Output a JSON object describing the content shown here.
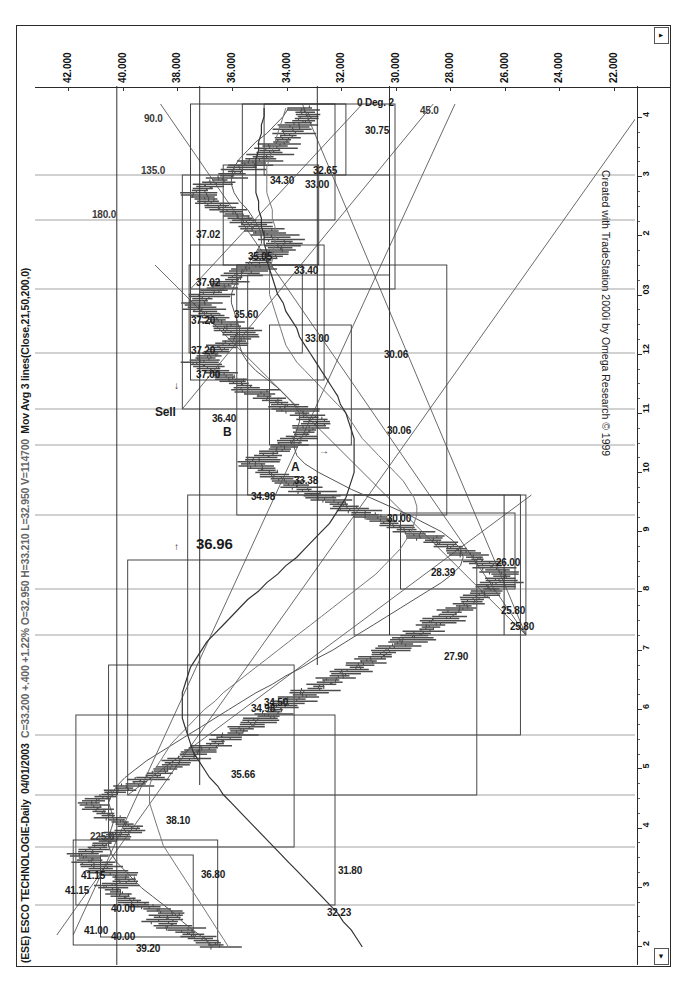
{
  "window": {
    "title_symbol": "(ESE) ESCO TECHNOLOGIE-Daily",
    "title_date": "04/01/2003",
    "title_quote": "C=33.200 +.400 +1.22%  O=32.950  H=33.210  L=32.950  V=114700",
    "title_study": "Mov Avg 3 lines(Close,21,50,200,0)",
    "credit": "Created with TradeStation 2000i by Omega Research © 1999",
    "scroll_left_icon": "◄",
    "scroll_right_icon": "▼"
  },
  "chart_data": {
    "type": "line",
    "title": "(ESE) ESCO TECHNOLOGIE-Daily",
    "xlabel": "",
    "ylabel": "Price",
    "ylim": [
      21.0,
      43.0
    ],
    "grid": false,
    "legend_position": "none",
    "price_axis_ticks": [
      "42.000",
      "40.000",
      "38.000",
      "36.000",
      "34.000",
      "32.000",
      "30.000",
      "28.000",
      "26.000",
      "24.000",
      "22.000"
    ],
    "price_axis_values": [
      42.0,
      40.0,
      38.0,
      36.0,
      34.0,
      32.0,
      30.0,
      28.0,
      26.0,
      24.0,
      22.0
    ],
    "date_axis_ticks": [
      "2",
      "3",
      "4",
      "5",
      "6",
      "7",
      "8",
      "9",
      "10",
      "11",
      "12",
      "03",
      "2",
      "3",
      "4"
    ],
    "quote": {
      "date": "04/01/2003",
      "close": 33.2,
      "change": 0.4,
      "change_pct": "+1.22%",
      "open": 32.95,
      "high": 33.21,
      "low": 32.95,
      "volume": 114700
    },
    "studies": [
      {
        "name": "Mov Avg 3 lines",
        "inputs": "Close,21,50,200,0"
      }
    ],
    "series": [
      {
        "name": "Close",
        "x": [
          0,
          1,
          2,
          3,
          4,
          5,
          6,
          7,
          8,
          9,
          10,
          11,
          12,
          13,
          14,
          15,
          16,
          17,
          18,
          19,
          20,
          21,
          22,
          23,
          24,
          25,
          26,
          27,
          28,
          29,
          30,
          31,
          32,
          33,
          34,
          35,
          36,
          37,
          38,
          39,
          40,
          41,
          42,
          43,
          44,
          45,
          46,
          47,
          48,
          49,
          50,
          51,
          52,
          53,
          54,
          55,
          56,
          57,
          58,
          59,
          60,
          61,
          62,
          63,
          64,
          65,
          66,
          67,
          68,
          69,
          70,
          71,
          72,
          73,
          74,
          75,
          76,
          77,
          78,
          79,
          80,
          81,
          82,
          83,
          84,
          85,
          86,
          87,
          88,
          89,
          90,
          91,
          92,
          93,
          94,
          95,
          96,
          97,
          98,
          99
        ],
        "values": [
          36.2,
          36.9,
          37.6,
          38.3,
          38.0,
          39.2,
          39.8,
          40.2,
          39.6,
          40.4,
          40.9,
          41.15,
          40.6,
          40.1,
          39.4,
          40.0,
          40.6,
          41.0,
          40.3,
          39.5,
          38.8,
          38.2,
          37.6,
          37.0,
          36.4,
          35.8,
          35.2,
          34.6,
          34.1,
          33.6,
          33.0,
          32.4,
          31.8,
          31.2,
          30.6,
          30.0,
          29.4,
          28.9,
          28.4,
          27.9,
          27.4,
          26.9,
          26.4,
          26.0,
          25.8,
          26.3,
          26.9,
          27.6,
          28.4,
          29.2,
          30.0,
          30.8,
          31.6,
          32.4,
          33.1,
          33.8,
          34.4,
          34.98,
          34.5,
          33.9,
          33.38,
          33.0,
          32.6,
          33.2,
          33.9,
          34.6,
          35.2,
          35.8,
          36.4,
          36.96,
          36.5,
          36.0,
          35.4,
          35.8,
          36.3,
          36.8,
          37.0,
          36.6,
          36.1,
          35.6,
          35.05,
          34.6,
          34.2,
          33.8,
          34.3,
          34.9,
          35.4,
          36.0,
          36.6,
          37.02,
          36.5,
          35.9,
          35.3,
          34.7,
          34.3,
          34.0,
          33.6,
          33.4,
          33.0,
          33.2
        ]
      },
      {
        "name": "MA 21",
        "values": [
          36.5,
          36.8,
          37.2,
          37.6,
          37.9,
          38.3,
          38.7,
          39.1,
          39.4,
          39.7,
          40.0,
          40.2,
          40.3,
          40.3,
          40.2,
          40.1,
          40.2,
          40.3,
          40.2,
          40.0,
          39.7,
          39.3,
          38.9,
          38.4,
          37.9,
          37.4,
          36.9,
          36.4,
          35.9,
          35.4,
          34.9,
          34.3,
          33.8,
          33.2,
          32.7,
          32.1,
          31.6,
          31.1,
          30.6,
          30.1,
          29.6,
          29.1,
          28.6,
          28.1,
          27.7,
          27.4,
          27.3,
          27.4,
          27.7,
          28.1,
          28.7,
          29.3,
          30.0,
          30.7,
          31.4,
          32.0,
          32.6,
          33.1,
          33.4,
          33.5,
          33.5,
          33.4,
          33.3,
          33.3,
          33.5,
          33.8,
          34.1,
          34.5,
          34.9,
          35.2,
          35.4,
          35.5,
          35.5,
          35.5,
          35.6,
          35.7,
          35.8,
          35.8,
          35.7,
          35.5,
          35.3,
          35.1,
          34.9,
          34.7,
          34.7,
          34.8,
          35.0,
          35.2,
          35.5,
          35.7,
          35.8,
          35.8,
          35.7,
          35.5,
          35.2,
          34.9,
          34.5,
          34.2,
          33.9,
          33.7
        ]
      },
      {
        "name": "MA 50",
        "values": [
          35.9,
          36.1,
          36.3,
          36.5,
          36.7,
          36.9,
          37.1,
          37.3,
          37.5,
          37.7,
          37.9,
          38.1,
          38.3,
          38.4,
          38.5,
          38.6,
          38.7,
          38.8,
          38.8,
          38.8,
          38.7,
          38.6,
          38.4,
          38.2,
          38.0,
          37.7,
          37.4,
          37.1,
          36.8,
          36.4,
          36.1,
          35.7,
          35.3,
          34.9,
          34.5,
          34.1,
          33.7,
          33.3,
          32.9,
          32.5,
          32.1,
          31.7,
          31.3,
          30.9,
          30.5,
          30.2,
          29.9,
          29.6,
          29.4,
          29.2,
          29.1,
          29.0,
          29.0,
          29.1,
          29.3,
          29.5,
          29.8,
          30.1,
          30.4,
          30.7,
          31.0,
          31.2,
          31.4,
          31.6,
          31.9,
          32.2,
          32.5,
          32.8,
          33.1,
          33.4,
          33.6,
          33.8,
          33.9,
          34.0,
          34.1,
          34.2,
          34.3,
          34.4,
          34.4,
          34.4,
          34.4,
          34.3,
          34.3,
          34.2,
          34.2,
          34.2,
          34.3,
          34.3,
          34.4,
          34.5,
          34.5,
          34.5,
          34.5,
          34.4,
          34.3,
          34.2,
          34.1,
          34.0,
          33.9,
          33.8
        ]
      },
      {
        "name": "MA 200",
        "values": [
          31.0,
          31.2,
          31.4,
          31.7,
          31.9,
          32.2,
          32.5,
          32.8,
          33.1,
          33.4,
          33.7,
          34.0,
          34.3,
          34.6,
          34.9,
          35.2,
          35.5,
          35.8,
          36.1,
          36.3,
          36.6,
          36.8,
          37.0,
          37.2,
          37.3,
          37.4,
          37.5,
          37.6,
          37.6,
          37.6,
          37.6,
          37.5,
          37.4,
          37.3,
          37.1,
          36.9,
          36.7,
          36.4,
          36.1,
          35.8,
          35.5,
          35.2,
          34.8,
          34.5,
          34.1,
          33.8,
          33.4,
          33.1,
          32.8,
          32.5,
          32.2,
          32.0,
          31.8,
          31.6,
          31.5,
          31.4,
          31.3,
          31.3,
          31.3,
          31.3,
          31.3,
          31.4,
          31.5,
          31.6,
          31.8,
          31.9,
          32.1,
          32.3,
          32.5,
          32.7,
          32.9,
          33.1,
          33.3,
          33.4,
          33.6,
          33.8,
          33.9,
          34.1,
          34.2,
          34.3,
          34.4,
          34.5,
          34.5,
          34.6,
          34.6,
          34.7,
          34.7,
          34.8,
          34.8,
          34.9,
          34.9,
          34.9,
          34.9,
          34.9,
          34.8,
          34.8,
          34.7,
          34.7,
          34.6,
          34.6
        ]
      }
    ]
  },
  "annotations": [
    {
      "id": "a01",
      "text": "41.15",
      "kind": "price"
    },
    {
      "id": "a02",
      "text": "41.00",
      "kind": "price"
    },
    {
      "id": "a03",
      "text": "41.15",
      "kind": "price"
    },
    {
      "id": "a04",
      "text": "40.00",
      "kind": "price"
    },
    {
      "id": "a05",
      "text": "40.00",
      "kind": "price"
    },
    {
      "id": "a06",
      "text": "39.20",
      "kind": "price"
    },
    {
      "id": "a07",
      "text": "38.10",
      "kind": "price"
    },
    {
      "id": "a08",
      "text": "36.80",
      "kind": "price"
    },
    {
      "id": "a09",
      "text": "35.66",
      "kind": "price"
    },
    {
      "id": "a10",
      "text": "34.50",
      "kind": "price"
    },
    {
      "id": "a11",
      "text": "32.23",
      "kind": "price"
    },
    {
      "id": "a12",
      "text": "31.80",
      "kind": "price"
    },
    {
      "id": "a13",
      "text": "27.90",
      "kind": "price"
    },
    {
      "id": "a14",
      "text": "25.80",
      "kind": "price"
    },
    {
      "id": "a15",
      "text": "26.00",
      "kind": "price"
    },
    {
      "id": "a16",
      "text": "25.80",
      "kind": "price"
    },
    {
      "id": "a17",
      "text": "28.39",
      "kind": "price"
    },
    {
      "id": "a18",
      "text": "34.98",
      "kind": "price"
    },
    {
      "id": "a19",
      "text": "34.98",
      "kind": "price"
    },
    {
      "id": "a20",
      "text": "33.38",
      "kind": "price"
    },
    {
      "id": "a21",
      "text": "36.96",
      "kind": "price-bold"
    },
    {
      "id": "a22",
      "text": "30.00",
      "kind": "price"
    },
    {
      "id": "a23",
      "text": "A",
      "kind": "label"
    },
    {
      "id": "a24",
      "text": "B",
      "kind": "label"
    },
    {
      "id": "a25",
      "text": "Sell",
      "kind": "signal"
    },
    {
      "id": "a26",
      "text": "37.00",
      "kind": "price"
    },
    {
      "id": "a27",
      "text": "36.40",
      "kind": "price"
    },
    {
      "id": "a28",
      "text": "30.06",
      "kind": "price"
    },
    {
      "id": "a29",
      "text": "30.06",
      "kind": "price"
    },
    {
      "id": "a30",
      "text": "37.20",
      "kind": "price"
    },
    {
      "id": "a31",
      "text": "37.20",
      "kind": "price"
    },
    {
      "id": "a32",
      "text": "35.60",
      "kind": "price"
    },
    {
      "id": "a33",
      "text": "33.00",
      "kind": "price"
    },
    {
      "id": "a34",
      "text": "37.02",
      "kind": "price"
    },
    {
      "id": "a35",
      "text": "37.02",
      "kind": "price"
    },
    {
      "id": "a36",
      "text": "180.0",
      "kind": "gann"
    },
    {
      "id": "a37",
      "text": "225.0",
      "kind": "gann"
    },
    {
      "id": "a38",
      "text": "135.0",
      "kind": "gann"
    },
    {
      "id": "a39",
      "text": "90.0",
      "kind": "gann"
    },
    {
      "id": "a40",
      "text": "45.0",
      "kind": "gann"
    },
    {
      "id": "a41",
      "text": "34.30",
      "kind": "price"
    },
    {
      "id": "a42",
      "text": "35.05",
      "kind": "price"
    },
    {
      "id": "a43",
      "text": "33.40",
      "kind": "price"
    },
    {
      "id": "a44",
      "text": "33.00",
      "kind": "price"
    },
    {
      "id": "a45",
      "text": "30.75",
      "kind": "price"
    },
    {
      "id": "a46",
      "text": "32.65",
      "kind": "price"
    },
    {
      "id": "a47",
      "text": "0 Deg. 2",
      "kind": "angle"
    },
    {
      "id": "a48",
      "text": "↓",
      "kind": "arrow"
    },
    {
      "id": "a49",
      "text": "↑",
      "kind": "arrow"
    },
    {
      "id": "a50",
      "text": "→",
      "kind": "arrow"
    }
  ],
  "colors": {
    "bar": "#4d4d4d",
    "ma_fast": "#555555",
    "ma_mid": "#777777",
    "ma_slow": "#333333",
    "box": "#333333",
    "frame": "#2a2a2a",
    "text": "#111111"
  }
}
